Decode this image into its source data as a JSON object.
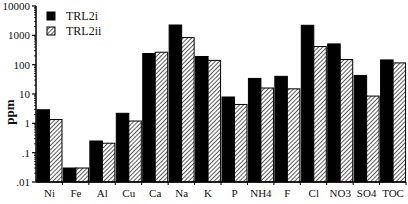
{
  "chart_data": {
    "type": "bar",
    "title": "",
    "xlabel": "",
    "ylabel": "ppm",
    "yscale": "log",
    "ylim": [
      0.01,
      10000
    ],
    "yticks": [
      {
        "value": 10000,
        "label": "10000"
      },
      {
        "value": 1000,
        "label": "1000"
      },
      {
        "value": 100,
        "label": "100"
      },
      {
        "value": 10,
        "label": "10"
      },
      {
        "value": 1,
        "label": "1"
      },
      {
        "value": 0.1,
        "label": ".1"
      },
      {
        "value": 0.01,
        "label": ".01"
      }
    ],
    "grid": false,
    "legend_position": "upper-left-inside",
    "categories": [
      "Ni",
      "Fe",
      "Al",
      "Cu",
      "Ca",
      "Na",
      "K",
      "P",
      "NH4",
      "F",
      "Cl",
      "NO3",
      "SO4",
      "TOC"
    ],
    "series": [
      {
        "name": "TRL2i",
        "fill": "solid",
        "color": "#000000",
        "values": [
          2.9,
          0.03,
          0.25,
          2.2,
          240,
          2250,
          190,
          7.9,
          34,
          40,
          2200,
          510,
          43,
          145
        ]
      },
      {
        "name": "TRL2ii",
        "fill": "hatched",
        "color": "#000000",
        "values": [
          1.35,
          0.03,
          0.21,
          1.2,
          265,
          840,
          140,
          4.4,
          16,
          15,
          415,
          150,
          8.5,
          115
        ]
      }
    ]
  }
}
